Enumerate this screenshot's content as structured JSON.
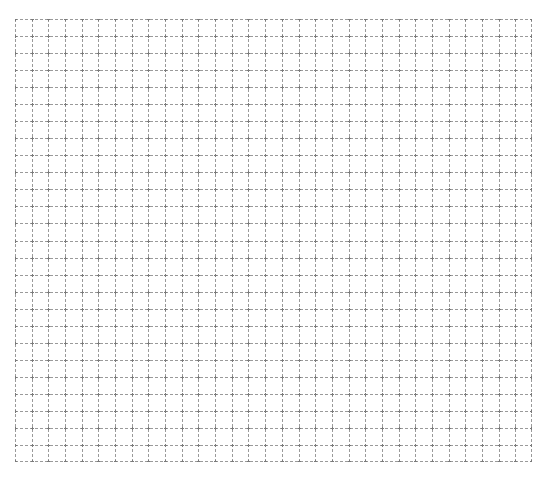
{
  "page": {
    "background": "#ffffff"
  },
  "header": {
    "left_text": "",
    "right_text": "",
    "note": "text along top edge is clipped and illegible"
  },
  "grid": {
    "columns": 31,
    "rows": 26,
    "line_color": "#9a9a9a",
    "line_style": "dashed",
    "dash_pattern": "3 2",
    "x": 15,
    "y": 19,
    "width": 517,
    "height": 443
  }
}
